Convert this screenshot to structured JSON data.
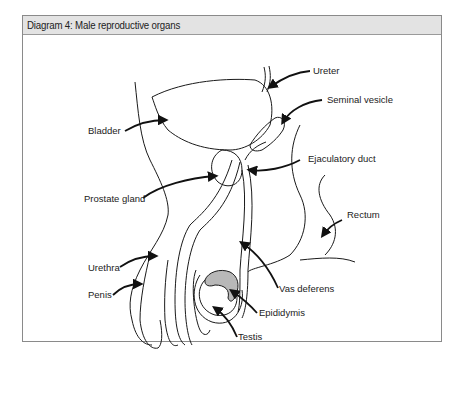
{
  "figure": {
    "caption": "Diagram 4: Male reproductive organs"
  },
  "labels": {
    "ureter": "Ureter",
    "seminal_vesicle": "Seminal vesicle",
    "bladder": "Bladder",
    "ejaculatory_duct": "Ejaculatory duct",
    "prostate_gland": "Prostate gland",
    "rectum": "Rectum",
    "urethra": "Urethra",
    "penis": "Penis",
    "vas_deferens": "Vas deferens",
    "epididymis": "Epididymis",
    "testis": "Testis"
  },
  "colors": {
    "outline": "#1a1a1a",
    "epididymis_fill": "#b8b8b8",
    "caption_bg": "#e3e3e3"
  }
}
